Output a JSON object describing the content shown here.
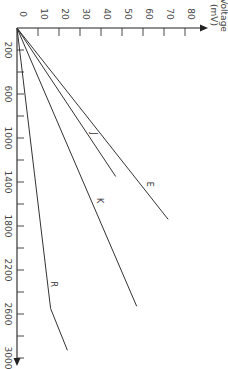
{
  "chart_data": {
    "type": "line",
    "title": "",
    "orientation": "rotated 90° clockwise (voltage axis runs left-to-right across top, temperature axis runs top-to-bottom)",
    "xlabel": "Voltage (mV)",
    "ylabel": "",
    "voltage_axis": {
      "label_line1": "Voltage",
      "label_line2": "(mV)",
      "ticks": [
        0,
        10,
        20,
        30,
        40,
        50,
        60,
        70,
        80
      ],
      "range": [
        0,
        85
      ]
    },
    "temperature_axis": {
      "major_ticks": [
        200,
        600,
        1000,
        1400,
        1800,
        2200,
        2600,
        3000
      ],
      "minor_ticks": [
        400,
        800,
        1200,
        1600,
        2000,
        2400,
        2800
      ],
      "range": [
        0,
        3100
      ]
    },
    "grid": false,
    "legend": "inline labels",
    "series": [
      {
        "name": "E",
        "points": [
          [
            0,
            0
          ],
          [
            72,
            1740
          ]
        ],
        "label_at": [
          62,
          1420
        ]
      },
      {
        "name": "J",
        "points": [
          [
            0,
            0
          ],
          [
            47,
            1350
          ]
        ],
        "label_at": [
          35,
          960
        ]
      },
      {
        "name": "K",
        "points": [
          [
            0,
            0
          ],
          [
            57,
            2530
          ]
        ],
        "label_at": [
          38,
          1570
        ]
      },
      {
        "name": "R",
        "points": [
          [
            0,
            0
          ],
          [
            16,
            2550
          ],
          [
            24,
            2930
          ]
        ],
        "label_at": [
          16,
          2330
        ]
      }
    ]
  },
  "labels": {
    "voltage_title_1": "Voltage",
    "voltage_title_2": "(mV)",
    "origin": "0"
  }
}
